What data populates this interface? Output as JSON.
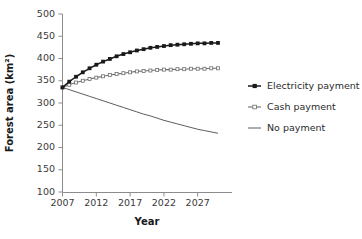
{
  "chart_data": {
    "type": "line",
    "title": "",
    "xlabel": "Year",
    "ylabel": "Forest area (km²)",
    "xlim": [
      2007,
      2030
    ],
    "ylim": [
      100,
      500
    ],
    "xticks": [
      2007,
      2012,
      2017,
      2022,
      2027
    ],
    "yticks": [
      100,
      150,
      200,
      250,
      300,
      350,
      400,
      450,
      500
    ],
    "grid": false,
    "legend_position": "right",
    "x": [
      2007,
      2008,
      2009,
      2010,
      2011,
      2012,
      2013,
      2014,
      2015,
      2016,
      2017,
      2018,
      2019,
      2020,
      2021,
      2022,
      2023,
      2024,
      2025,
      2026,
      2027,
      2028,
      2029,
      2030
    ],
    "series": [
      {
        "name": "Electricity payment",
        "color": "#1a1a1a",
        "marker": "filled-square",
        "values": [
          335,
          348,
          359,
          369,
          378,
          386,
          393,
          399,
          405,
          410,
          414,
          418,
          421,
          424,
          426,
          428,
          430,
          431,
          432,
          433,
          434,
          434,
          435,
          435
        ]
      },
      {
        "name": "Cash payment",
        "color": "#6e6e6e",
        "marker": "open-square",
        "values": [
          335,
          341,
          346,
          350,
          354,
          357,
          360,
          363,
          365,
          367,
          369,
          371,
          372,
          373,
          374,
          375,
          375,
          376,
          376,
          377,
          377,
          377,
          378,
          378
        ]
      },
      {
        "name": "No payment",
        "color": "#4a4a4a",
        "marker": "none",
        "values": [
          335,
          330,
          325,
          320,
          315,
          310,
          305,
          300,
          295,
          290,
          285,
          280,
          275,
          271,
          266,
          261,
          257,
          253,
          249,
          245,
          241,
          238,
          235,
          232
        ]
      }
    ]
  },
  "legend": {
    "items": [
      {
        "label": "Electricity payment"
      },
      {
        "label": "Cash payment"
      },
      {
        "label": "No payment"
      }
    ]
  }
}
